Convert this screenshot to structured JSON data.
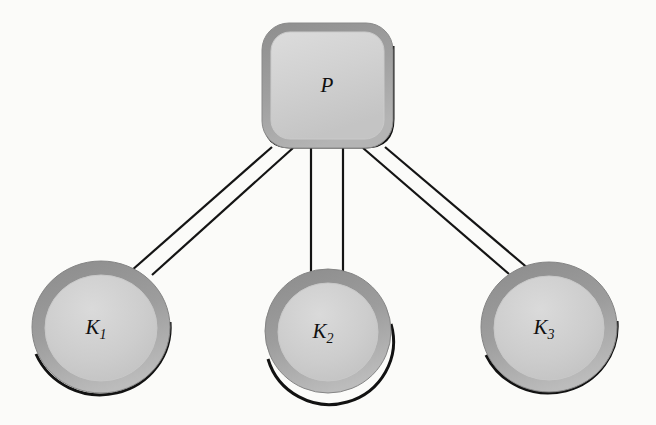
{
  "figure": {
    "kind": "node-link-diagram",
    "background_color": "#fbfbf9"
  },
  "palette": {
    "background": "#fbfbf9",
    "node_fill_inner": "#cfcfcf",
    "node_fill_ring": "#9c9c9c",
    "node_outline": "#121212",
    "link_stroke": "#141414",
    "label_color": "#101010"
  },
  "nodes": [
    {
      "id": "P",
      "shape": "rounded-square",
      "label_main": "P",
      "label_sub": "",
      "cx": 327,
      "cy": 85,
      "width": 131,
      "height": 125,
      "corner_radius": 26,
      "ring_width": 9
    },
    {
      "id": "K1",
      "shape": "circle",
      "label_main": "K",
      "label_sub": "1",
      "cx": 101,
      "cy": 327,
      "rx": 69,
      "ry": 66,
      "ring_width": 13
    },
    {
      "id": "K2",
      "shape": "circle",
      "label_main": "K",
      "label_sub": "2",
      "cx": 328,
      "cy": 331,
      "rx": 63,
      "ry": 62,
      "ring_width": 13
    },
    {
      "id": "K3",
      "shape": "circle",
      "label_main": "K",
      "label_sub": "3",
      "cx": 549,
      "cy": 327,
      "rx": 68,
      "ry": 65,
      "ring_width": 13
    }
  ],
  "links": [
    {
      "id": "link-P-K1",
      "from": "P",
      "to": "K1",
      "style": "double-line",
      "lines": [
        {
          "x1": 272,
          "y1": 147,
          "x2": 131,
          "y2": 271
        },
        {
          "x1": 293,
          "y1": 148,
          "x2": 152,
          "y2": 275
        }
      ]
    },
    {
      "id": "link-P-K2",
      "from": "P",
      "to": "K2",
      "style": "double-line",
      "lines": [
        {
          "x1": 311,
          "y1": 148,
          "x2": 311,
          "y2": 272
        },
        {
          "x1": 343,
          "y1": 148,
          "x2": 343,
          "y2": 272
        }
      ]
    },
    {
      "id": "link-P-K3",
      "from": "P",
      "to": "K3",
      "style": "double-line",
      "lines": [
        {
          "x1": 363,
          "y1": 148,
          "x2": 509,
          "y2": 274
        },
        {
          "x1": 385,
          "y1": 147,
          "x2": 530,
          "y2": 270
        }
      ]
    }
  ]
}
